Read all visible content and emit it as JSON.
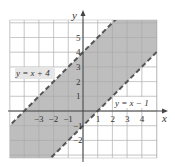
{
  "chart_data": {
    "type": "inequality-region",
    "title": "",
    "xlabel": "x",
    "ylabel": "y",
    "xlim": [
      -5,
      5
    ],
    "ylim": [
      -3.2,
      6.2
    ],
    "grid": true,
    "x_ticks": [
      "-3",
      "-2",
      "-1",
      "1",
      "2",
      "3",
      "4"
    ],
    "y_ticks": [
      "-2",
      "-1",
      "1",
      "2",
      "3",
      "4",
      "5"
    ],
    "x_tick_values": [
      -3,
      -2,
      -1,
      1,
      2,
      3,
      4
    ],
    "y_tick_values": [
      -2,
      -1,
      1,
      2,
      3,
      4,
      5
    ],
    "boundaries": [
      {
        "label": "y = x + 4",
        "slope": 1,
        "intercept": 4,
        "style": "dashed"
      },
      {
        "label": "y = x − 1",
        "slope": 1,
        "intercept": -1,
        "style": "dashed"
      }
    ],
    "shaded_region": "x - 1 < y < x + 4",
    "shade_color": "#b3b3b3",
    "line_color": "#555555",
    "grid_color": "#d0d0d0",
    "axis_color": "#444444"
  },
  "labels": {
    "x_axis": "x",
    "y_axis": "y",
    "upper_line": "y = x + 4",
    "lower_line": "y = x − 1"
  }
}
